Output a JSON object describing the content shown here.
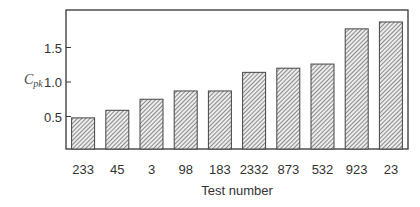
{
  "chart_data": {
    "type": "bar",
    "title": "",
    "xlabel": "Test number",
    "ylabel": "C_pk",
    "ylabel_main": "C",
    "ylabel_sub": "pk",
    "categories": [
      "233",
      "45",
      "3",
      "98",
      "183",
      "2332",
      "873",
      "532",
      "923",
      "23"
    ],
    "values": [
      0.48,
      0.59,
      0.75,
      0.87,
      0.87,
      1.14,
      1.2,
      1.26,
      1.77,
      1.87
    ],
    "yticks": [
      0.5,
      1.0,
      1.5
    ],
    "ytick_labels": [
      "0.5",
      "1.0",
      "1.5"
    ],
    "ylim": [
      0,
      2.0
    ],
    "grid": false,
    "legend": null,
    "bar_fill": "hatched diagonal",
    "colors": {
      "hatch": "#555555",
      "bar_bg": "#e8e8e8",
      "frame": "#333333"
    }
  }
}
